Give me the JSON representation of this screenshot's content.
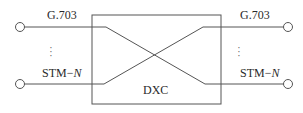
{
  "diagram": {
    "center_label": "DXC",
    "left_ports": {
      "top_label": "G.703",
      "bottom_label_prefix": "STM−",
      "bottom_label_var": "N",
      "ellipsis": "⋮"
    },
    "right_ports": {
      "top_label": "G.703",
      "bottom_label_prefix": "STM−",
      "bottom_label_var": "N",
      "ellipsis": "⋮"
    },
    "colors": {
      "line": "#555555",
      "text": "#2a2a2a",
      "background": "#ffffff"
    }
  }
}
